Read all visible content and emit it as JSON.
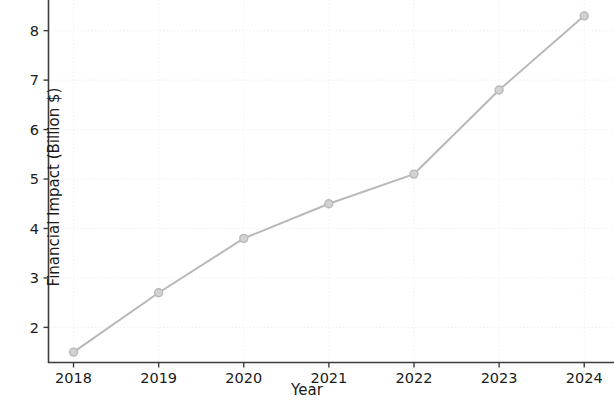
{
  "chart_data": {
    "type": "line",
    "title": "",
    "xlabel": "Year",
    "ylabel": "Financial Impact (Billion $)",
    "categories": [
      "2018",
      "2019",
      "2020",
      "2021",
      "2022",
      "2023",
      "2024"
    ],
    "x": [
      2018,
      2019,
      2020,
      2021,
      2022,
      2023,
      2024
    ],
    "values": [
      1.5,
      2.7,
      3.8,
      4.5,
      5.1,
      6.8,
      8.3
    ],
    "series": [
      {
        "name": "Financial Impact",
        "values": [
          1.5,
          2.7,
          3.8,
          4.5,
          5.1,
          6.8,
          8.3
        ]
      }
    ],
    "xtick_labels": [
      "2018",
      "2019",
      "2020",
      "2021",
      "2022",
      "2023",
      "2024"
    ],
    "ytick_labels": [
      "2",
      "3",
      "4",
      "5",
      "6",
      "7",
      "8"
    ],
    "ytick_values": [
      2,
      3,
      4,
      5,
      6,
      7,
      8
    ],
    "xlim": [
      2017.7,
      2024.35
    ],
    "ylim": [
      1.28,
      8.62
    ],
    "grid": true,
    "grid_style": "dotted",
    "legend": null,
    "marker": "circle",
    "line_color": "#b8b8b8",
    "marker_color": "#b9b9b9",
    "grid_color": "#f0f0f0",
    "axis_color": "#3c3c3c",
    "text_color": "#1a1a1a",
    "background_color": "#ffffff"
  }
}
